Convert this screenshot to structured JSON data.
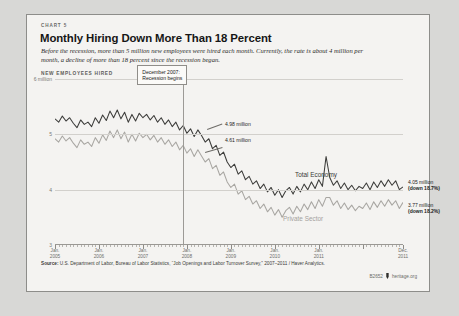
{
  "card": {
    "eyebrow": "CHART 5",
    "title": "Monthly Hiring Down More Than 18 Percent",
    "deck": "Before the recession, more than 5 million new employees were hired each month. Currently, the rate is about 4 million per month, a decline of more than 18 percent since the recession began.",
    "axis_title": "NEW EMPLOYEES HIRED",
    "source": "Source: U.S. Department of Labor, Bureau of Labor Statistics, “Job Openings and Labor Turnover Survey,” 2007–2011 / Haver Analytics.",
    "source_label": "Source:",
    "chart_code": "B2652",
    "site": "heritage.org"
  },
  "annotations": {
    "recession_box": "December 2007:\nRecession begins",
    "recession_box_line1": "December 2007:",
    "recession_box_line2": "Recession begins",
    "total_at_recession": "4.98 million",
    "private_at_recession": "4.61 million",
    "total_end_value": "4.05 million",
    "total_end_change": "(down 18.7%)",
    "private_end_value": "3.77 million",
    "private_end_change": "(down 18.2%)"
  },
  "chart_data": {
    "type": "line",
    "title": "Monthly Hiring Down More Than 18 Percent",
    "subtitle": "Before the recession, more than 5 million new employees were hired each month. Currently, the rate is about 4 million per month, a decline of more than 18 percent since the recession began.",
    "xlabel": "",
    "ylabel": "NEW EMPLOYEES HIRED",
    "ylim": [
      3,
      6
    ],
    "yticks": [
      3,
      4,
      5,
      6
    ],
    "ytick_labels": [
      "3",
      "4",
      "5",
      "6 million"
    ],
    "grid": true,
    "legend_position": "inline",
    "x_start": "2005-01",
    "x_end": "2011-12",
    "xtick_labels": [
      {
        "line1": "Jan.",
        "line2": "2005"
      },
      {
        "line1": "Jan.",
        "line2": "2006"
      },
      {
        "line1": "Jan.",
        "line2": "2007"
      },
      {
        "line1": "Jan.",
        "line2": "2008"
      },
      {
        "line1": "Jan.",
        "line2": "2009"
      },
      {
        "line1": "Jan.",
        "line2": "2010"
      },
      {
        "line1": "Jan.",
        "line2": "2011"
      },
      {
        "line1": "Dec.",
        "line2": "2011"
      }
    ],
    "marker_line": {
      "label": "December 2007: Recession begins",
      "x": "2007-12"
    },
    "series": [
      {
        "name": "Total Economy",
        "color": "#3b3b39",
        "values": [
          5.28,
          5.22,
          5.33,
          5.24,
          5.3,
          5.2,
          5.12,
          5.26,
          5.18,
          5.22,
          5.14,
          5.3,
          5.2,
          5.35,
          5.25,
          5.42,
          5.3,
          5.44,
          5.28,
          5.4,
          5.22,
          5.36,
          5.24,
          5.38,
          5.3,
          5.36,
          5.26,
          5.34,
          5.22,
          5.3,
          5.18,
          5.26,
          5.14,
          5.22,
          5.08,
          5.16,
          5.02,
          5.1,
          4.96,
          5.08,
          4.98,
          4.86,
          4.92,
          4.74,
          4.8,
          4.62,
          4.68,
          4.5,
          4.4,
          4.46,
          4.28,
          4.34,
          4.18,
          4.24,
          4.1,
          4.16,
          4.02,
          4.1,
          3.96,
          4.04,
          3.9,
          4.0,
          3.86,
          3.98,
          4.04,
          3.92,
          4.06,
          3.96,
          4.1,
          4.0,
          4.14,
          4.02,
          4.18,
          4.06,
          4.6,
          4.22,
          4.08,
          4.16,
          4.02,
          4.12,
          4.0,
          4.08,
          3.98,
          4.06,
          4.02,
          4.12,
          4.0,
          4.14,
          4.04,
          4.16,
          4.06,
          4.18,
          4.08,
          4.16,
          4.0,
          4.05
        ]
      },
      {
        "name": "Private Sector",
        "color": "#a8a6a2",
        "values": [
          4.92,
          4.86,
          4.97,
          4.88,
          4.94,
          4.84,
          4.76,
          4.9,
          4.82,
          4.86,
          4.78,
          4.94,
          4.84,
          4.99,
          4.89,
          5.06,
          4.94,
          5.08,
          4.92,
          5.04,
          4.86,
          5.0,
          4.88,
          5.02,
          4.94,
          5.0,
          4.9,
          4.98,
          4.86,
          4.94,
          4.82,
          4.9,
          4.78,
          4.86,
          4.72,
          4.8,
          4.66,
          4.74,
          4.6,
          4.72,
          4.61,
          4.5,
          4.56,
          4.38,
          4.44,
          4.26,
          4.32,
          4.14,
          4.04,
          4.1,
          3.92,
          3.98,
          3.82,
          3.88,
          3.74,
          3.8,
          3.66,
          3.74,
          3.6,
          3.68,
          3.54,
          3.64,
          3.5,
          3.62,
          3.68,
          3.56,
          3.7,
          3.6,
          3.74,
          3.64,
          3.78,
          3.66,
          3.82,
          3.7,
          3.86,
          3.86,
          3.72,
          3.8,
          3.66,
          3.76,
          3.64,
          3.72,
          3.62,
          3.7,
          3.66,
          3.76,
          3.64,
          3.78,
          3.68,
          3.8,
          3.7,
          3.82,
          3.72,
          3.8,
          3.66,
          3.77
        ]
      }
    ]
  }
}
